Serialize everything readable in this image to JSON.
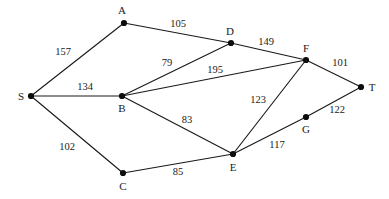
{
  "figure": {
    "name": "weighted-undirected-graph",
    "width": 389,
    "height": 199,
    "background": "#ffffff",
    "ink_color": "#1a1a1a"
  },
  "chart_data": {
    "type": "diagram",
    "title": "",
    "graph_kind": "weighted undirected graph",
    "nodes": [
      {
        "id": "S",
        "label": "S",
        "x": 31,
        "y": 96,
        "label_x": 21,
        "label_y": 96
      },
      {
        "id": "A",
        "label": "A",
        "x": 124,
        "y": 23,
        "label_x": 122,
        "label_y": 10
      },
      {
        "id": "B",
        "label": "B",
        "x": 122,
        "y": 96,
        "label_x": 122,
        "label_y": 108
      },
      {
        "id": "C",
        "label": "C",
        "x": 123,
        "y": 173,
        "label_x": 123,
        "label_y": 186
      },
      {
        "id": "D",
        "label": "D",
        "x": 231,
        "y": 43,
        "label_x": 230,
        "label_y": 31
      },
      {
        "id": "E",
        "label": "E",
        "x": 233,
        "y": 154,
        "label_x": 233,
        "label_y": 167
      },
      {
        "id": "F",
        "label": "F",
        "x": 306,
        "y": 60,
        "label_x": 306,
        "label_y": 48
      },
      {
        "id": "G",
        "label": "G",
        "x": 306,
        "y": 117,
        "label_x": 306,
        "label_y": 129
      },
      {
        "id": "T",
        "label": "T",
        "x": 361,
        "y": 87,
        "label_x": 372,
        "label_y": 87
      }
    ],
    "edges": [
      {
        "from": "S",
        "to": "A",
        "weight": 157,
        "label_x": 63,
        "label_y": 52
      },
      {
        "from": "S",
        "to": "B",
        "weight": 134,
        "label_x": 85,
        "label_y": 87
      },
      {
        "from": "S",
        "to": "C",
        "weight": 102,
        "label_x": 67,
        "label_y": 147
      },
      {
        "from": "A",
        "to": "D",
        "weight": 105,
        "label_x": 178,
        "label_y": 24
      },
      {
        "from": "B",
        "to": "D",
        "weight": 79,
        "label_x": 167,
        "label_y": 63
      },
      {
        "from": "B",
        "to": "F",
        "weight": 195,
        "label_x": 215,
        "label_y": 70
      },
      {
        "from": "B",
        "to": "E",
        "weight": 83,
        "label_x": 187,
        "label_y": 120
      },
      {
        "from": "D",
        "to": "F",
        "weight": 149,
        "label_x": 266,
        "label_y": 42
      },
      {
        "from": "E",
        "to": "F",
        "weight": 123,
        "label_x": 258,
        "label_y": 100
      },
      {
        "from": "C",
        "to": "E",
        "weight": 85,
        "label_x": 178,
        "label_y": 172
      },
      {
        "from": "E",
        "to": "G",
        "weight": 117,
        "label_x": 277,
        "label_y": 145
      },
      {
        "from": "G",
        "to": "T",
        "weight": 122,
        "label_x": 337,
        "label_y": 110
      },
      {
        "from": "F",
        "to": "T",
        "weight": 101,
        "label_x": 340,
        "label_y": 63
      }
    ]
  }
}
